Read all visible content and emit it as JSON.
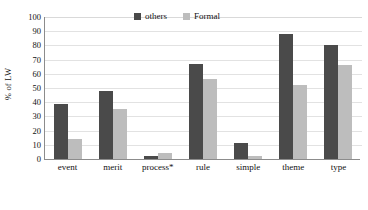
{
  "chart_data": {
    "type": "bar",
    "title": "",
    "xlabel": "",
    "ylabel": "% of LW",
    "ylim": [
      0,
      100
    ],
    "yticks": [
      100,
      90,
      80,
      70,
      60,
      50,
      40,
      30,
      20,
      10,
      0
    ],
    "grid": true,
    "legend_position": "top-center",
    "categories": [
      "event",
      "merit",
      "process*",
      "rule",
      "simple",
      "theme",
      "type"
    ],
    "series": [
      {
        "name": "others",
        "color": "#4a4a4a",
        "values": [
          39,
          48,
          2,
          67,
          11,
          88,
          80
        ]
      },
      {
        "name": "Formal",
        "color": "#bdbdbd",
        "values": [
          14,
          35,
          4,
          56,
          2,
          52,
          66
        ]
      }
    ]
  },
  "caption": "",
  "colors": {
    "series_others": "#4a4a4a",
    "series_formal": "#bdbdbd",
    "axis": "#8c8c8c",
    "gridline": "#e2e2e2",
    "text": "#111111",
    "background": "#ffffff"
  }
}
